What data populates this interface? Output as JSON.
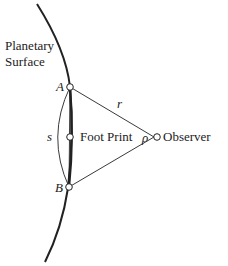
{
  "diagram": {
    "surface_label_line1": "Planetary",
    "surface_label_line2": "Surface",
    "point_a": "A",
    "point_b": "B",
    "arc_label": "s",
    "footprint_label": "Foot Print",
    "range_label": "r",
    "angle_label": "ρ",
    "observer_label": "Observer",
    "colors": {
      "line": "#222222",
      "background": "#ffffff"
    }
  }
}
